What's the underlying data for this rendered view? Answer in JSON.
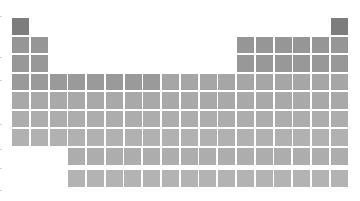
{
  "grid": {
    "origin_x": 12,
    "origin_y": 18,
    "pitch_x": 18.75,
    "pitch_y": 18.5,
    "f_block_y": [
      148,
      170
    ],
    "f_block_start_x": 68
  },
  "shades": {
    "period1": "#7d7d7d",
    "period2": "#969696",
    "period3": "#989898",
    "period4_left": "#9a9a9a",
    "period4_right": "#a6a6a6",
    "period5": "#a9a9a9",
    "period6": "#adadad",
    "period7": "#b1b1b1",
    "lanthanides": "#adadad",
    "actinides": "#b3b3b3"
  },
  "layout": {
    "periods": [
      {
        "period": 1,
        "columns": [
          1,
          18
        ]
      },
      {
        "period": 2,
        "columns": [
          1,
          2,
          13,
          14,
          15,
          16,
          17,
          18
        ]
      },
      {
        "period": 3,
        "columns": [
          1,
          2,
          13,
          14,
          15,
          16,
          17,
          18
        ]
      },
      {
        "period": 4,
        "columns": [
          1,
          2,
          3,
          4,
          5,
          6,
          7,
          8,
          9,
          10,
          11,
          12,
          13,
          14,
          15,
          16,
          17,
          18
        ]
      },
      {
        "period": 5,
        "columns": [
          1,
          2,
          3,
          4,
          5,
          6,
          7,
          8,
          9,
          10,
          11,
          12,
          13,
          14,
          15,
          16,
          17,
          18
        ]
      },
      {
        "period": 6,
        "columns": [
          1,
          2,
          3,
          4,
          5,
          6,
          7,
          8,
          9,
          10,
          11,
          12,
          13,
          14,
          15,
          16,
          17,
          18
        ]
      },
      {
        "period": 7,
        "columns": [
          1,
          2,
          3,
          4,
          5,
          6,
          7,
          8,
          9,
          10,
          11,
          12,
          13,
          14,
          15,
          16,
          17,
          18
        ]
      }
    ],
    "f_block_rows": [
      {
        "name": "lanthanides",
        "count": 15
      },
      {
        "name": "actinides",
        "count": 15
      }
    ]
  },
  "left_ticks_y": [
    16,
    57,
    80,
    124,
    149,
    168,
    190
  ]
}
